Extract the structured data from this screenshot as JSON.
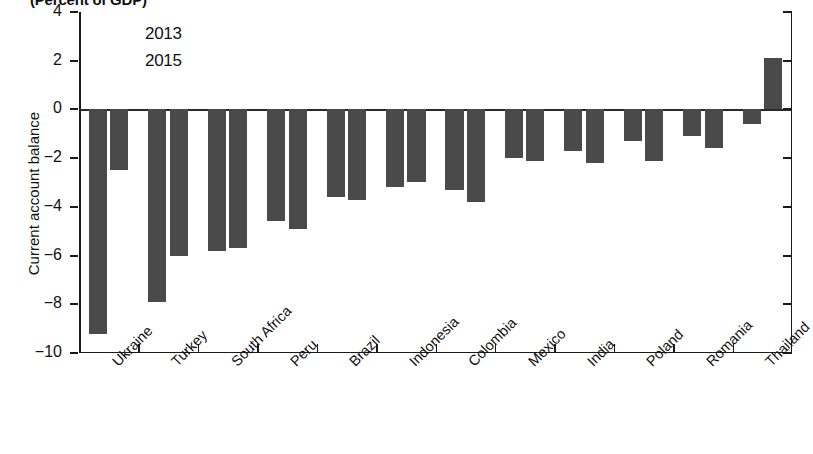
{
  "chart_data": {
    "type": "bar",
    "title": "(Percent of GDP)",
    "xlabel": "",
    "ylabel": "Current account balance",
    "ylim": [
      -10,
      4
    ],
    "yticks": [
      4,
      2,
      0,
      -2,
      -4,
      -6,
      -8,
      -10
    ],
    "ytick_labels": [
      "4",
      "2",
      "0",
      "−2",
      "−4",
      "−6",
      "−8",
      "−10"
    ],
    "grid": false,
    "legend_position": "top-left-inside",
    "categories": [
      "Ukraine",
      "Turkey",
      "South Africa",
      "Peru",
      "Brazil",
      "Indonesia",
      "Colombia",
      "Mexico",
      "India",
      "Poland",
      "Romania",
      "Thailand"
    ],
    "series": [
      {
        "name": "2013",
        "color": "#4a4a4a",
        "values": [
          -9.2,
          -7.9,
          -5.8,
          -4.6,
          -3.6,
          -3.2,
          -3.3,
          -2.0,
          -1.7,
          -1.3,
          -1.1,
          -0.6
        ]
      },
      {
        "name": "2015",
        "color": "#4a4a4a",
        "values": [
          -2.5,
          -6.0,
          -5.7,
          -4.9,
          -3.7,
          -3.0,
          -3.8,
          -2.1,
          -2.2,
          -2.1,
          -1.6,
          2.1
        ]
      }
    ]
  }
}
